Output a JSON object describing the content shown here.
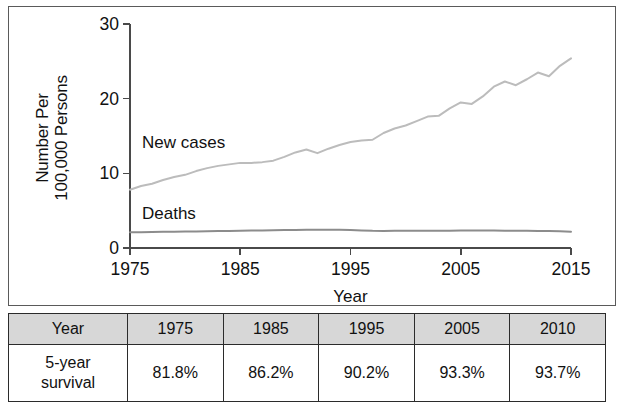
{
  "chart_data": {
    "type": "line",
    "title": "",
    "xlabel": "Year",
    "ylabel": "Number Per 100,000 Persons",
    "xlim": [
      1975,
      2015
    ],
    "ylim": [
      0,
      30
    ],
    "xticks": [
      "1975",
      "1985",
      "1995",
      "2005",
      "2015"
    ],
    "yticks": [
      "0",
      "10",
      "20",
      "30"
    ],
    "grid": false,
    "legend_position": "inline-annotations",
    "annotations": [
      "New cases",
      "Deaths"
    ],
    "series": [
      {
        "name": "New cases",
        "color": "#bcbcbc",
        "x": [
          1975,
          1976,
          1977,
          1978,
          1979,
          1980,
          1981,
          1982,
          1983,
          1984,
          1985,
          1986,
          1987,
          1988,
          1989,
          1990,
          1991,
          1992,
          1993,
          1994,
          1995,
          1996,
          1997,
          1998,
          1999,
          2000,
          2001,
          2002,
          2003,
          2004,
          2005,
          2006,
          2007,
          2008,
          2009,
          2010,
          2011,
          2012,
          2013,
          2014,
          2015
        ],
        "values": [
          7.8,
          8.3,
          8.6,
          9.1,
          9.5,
          9.8,
          10.3,
          10.7,
          11.0,
          11.2,
          11.4,
          11.4,
          11.5,
          11.7,
          12.2,
          12.8,
          13.2,
          12.7,
          13.3,
          13.8,
          14.2,
          14.4,
          14.5,
          15.4,
          16.0,
          16.4,
          17.0,
          17.6,
          17.7,
          18.7,
          19.5,
          19.3,
          20.3,
          21.6,
          22.3,
          21.8,
          22.6,
          23.5,
          23.0,
          24.4,
          25.4
        ]
      },
      {
        "name": "Deaths",
        "color": "#8c8c8c",
        "x": [
          1975,
          1976,
          1977,
          1978,
          1979,
          1980,
          1981,
          1982,
          1983,
          1984,
          1985,
          1986,
          1987,
          1988,
          1989,
          1990,
          1991,
          1992,
          1993,
          1994,
          1995,
          1996,
          1997,
          1998,
          1999,
          2000,
          2001,
          2002,
          2003,
          2004,
          2005,
          2006,
          2007,
          2008,
          2009,
          2010,
          2011,
          2012,
          2013,
          2014,
          2015
        ],
        "values": [
          2.1,
          2.12,
          2.15,
          2.17,
          2.18,
          2.2,
          2.22,
          2.25,
          2.27,
          2.28,
          2.3,
          2.33,
          2.36,
          2.38,
          2.4,
          2.42,
          2.45,
          2.46,
          2.45,
          2.43,
          2.4,
          2.36,
          2.3,
          2.28,
          2.3,
          2.32,
          2.31,
          2.3,
          2.31,
          2.32,
          2.33,
          2.33,
          2.34,
          2.33,
          2.32,
          2.31,
          2.3,
          2.29,
          2.27,
          2.24,
          2.18
        ]
      }
    ]
  },
  "table": {
    "header": [
      "Year",
      "1975",
      "1985",
      "1995",
      "2005",
      "2010"
    ],
    "rows": [
      {
        "label": "5-year survival",
        "label_line1": "5-year",
        "label_line2": "survival",
        "values": [
          "81.8%",
          "86.2%",
          "90.2%",
          "93.3%",
          "93.7%"
        ]
      }
    ]
  }
}
